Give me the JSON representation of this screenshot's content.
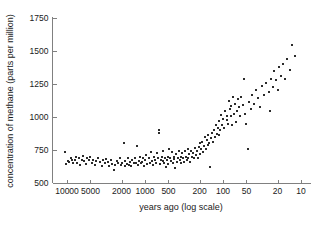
{
  "chart_data": {
    "type": "scatter",
    "title": "",
    "xlabel": "years ago (log scale)",
    "ylabel": "concentration of methane (parts per million)",
    "xscale": "log",
    "x_reversed": true,
    "xlim": [
      10,
      12000
    ],
    "ylim": [
      500,
      1750
    ],
    "grid": false,
    "legend": null,
    "xticks": [
      10000,
      5000,
      2000,
      1000,
      500,
      200,
      100,
      50,
      20,
      10
    ],
    "xticklabels": [
      "10000",
      "5000",
      "2000",
      "1000",
      "500",
      "200",
      "100",
      "50",
      "20",
      "10"
    ],
    "yticks": [
      500,
      750,
      1000,
      1250,
      1500,
      1750
    ],
    "yticklabels": [
      "500",
      "750",
      "1000",
      "1250",
      "1500",
      "1750"
    ],
    "marker": "square",
    "marker_color": "#2b2b2b",
    "marker_size": 2,
    "points": [
      [
        10500,
        735
      ],
      [
        10200,
        645
      ],
      [
        9700,
        668
      ],
      [
        9300,
        660
      ],
      [
        9000,
        690
      ],
      [
        8600,
        672
      ],
      [
        8300,
        648
      ],
      [
        8000,
        678
      ],
      [
        7700,
        700
      ],
      [
        7400,
        655
      ],
      [
        7100,
        688
      ],
      [
        6800,
        640
      ],
      [
        6500,
        672
      ],
      [
        6250,
        702
      ],
      [
        6000,
        665
      ],
      [
        5750,
        645
      ],
      [
        5500,
        686
      ],
      [
        5250,
        672
      ],
      [
        5000,
        700
      ],
      [
        4800,
        652
      ],
      [
        4600,
        678
      ],
      [
        4400,
        640
      ],
      [
        4200,
        668
      ],
      [
        4000,
        690
      ],
      [
        3800,
        660
      ],
      [
        3600,
        628
      ],
      [
        3450,
        672
      ],
      [
        3300,
        648
      ],
      [
        3150,
        684
      ],
      [
        3000,
        662
      ],
      [
        2880,
        632
      ],
      [
        2760,
        672
      ],
      [
        2640,
        645
      ],
      [
        2520,
        600
      ],
      [
        2400,
        638
      ],
      [
        2300,
        668
      ],
      [
        2200,
        655
      ],
      [
        2100,
        690
      ],
      [
        2020,
        640
      ],
      [
        1950,
        652
      ],
      [
        1880,
        805
      ],
      [
        1830,
        628
      ],
      [
        1780,
        668
      ],
      [
        1720,
        645
      ],
      [
        1660,
        688
      ],
      [
        1600,
        640
      ],
      [
        1550,
        660
      ],
      [
        1500,
        632
      ],
      [
        1450,
        672
      ],
      [
        1400,
        648
      ],
      [
        1360,
        690
      ],
      [
        1320,
        655
      ],
      [
        1280,
        778
      ],
      [
        1240,
        640
      ],
      [
        1200,
        668
      ],
      [
        1160,
        700
      ],
      [
        1120,
        648
      ],
      [
        1080,
        660
      ],
      [
        1050,
        690
      ],
      [
        1020,
        632
      ],
      [
        990,
        672
      ],
      [
        960,
        712
      ],
      [
        930,
        645
      ],
      [
        900,
        688
      ],
      [
        870,
        655
      ],
      [
        845,
        735
      ],
      [
        820,
        668
      ],
      [
        795,
        640
      ],
      [
        770,
        700
      ],
      [
        745,
        672
      ],
      [
        720,
        655
      ],
      [
        700,
        725
      ],
      [
        680,
        690
      ],
      [
        660,
        900
      ],
      [
        655,
        880
      ],
      [
        640,
        645
      ],
      [
        625,
        672
      ],
      [
        610,
        700
      ],
      [
        595,
        668
      ],
      [
        580,
        740
      ],
      [
        565,
        655
      ],
      [
        550,
        688
      ],
      [
        540,
        620
      ],
      [
        525,
        672
      ],
      [
        512,
        700
      ],
      [
        500,
        645
      ],
      [
        488,
        760
      ],
      [
        476,
        690
      ],
      [
        464,
        668
      ],
      [
        452,
        735
      ],
      [
        440,
        655
      ],
      [
        430,
        700
      ],
      [
        420,
        680
      ],
      [
        410,
        612
      ],
      [
        400,
        722
      ],
      [
        390,
        660
      ],
      [
        380,
        690
      ],
      [
        370,
        745
      ],
      [
        360,
        672
      ],
      [
        350,
        700
      ],
      [
        342,
        648
      ],
      [
        334,
        725
      ],
      [
        325,
        688
      ],
      [
        317,
        660
      ],
      [
        309,
        740
      ],
      [
        300,
        700
      ],
      [
        292,
        672
      ],
      [
        285,
        755
      ],
      [
        278,
        690
      ],
      [
        270,
        718
      ],
      [
        263,
        662
      ],
      [
        256,
        745
      ],
      [
        250,
        700
      ],
      [
        243,
        728
      ],
      [
        237,
        688
      ],
      [
        230,
        765
      ],
      [
        224,
        712
      ],
      [
        218,
        740
      ],
      [
        212,
        690
      ],
      [
        206,
        772
      ],
      [
        200,
        722
      ],
      [
        195,
        800
      ],
      [
        190,
        755
      ],
      [
        185,
        812
      ],
      [
        180,
        735
      ],
      [
        175,
        782
      ],
      [
        170,
        848
      ],
      [
        166,
        760
      ],
      [
        162,
        825
      ],
      [
        158,
        790
      ],
      [
        154,
        862
      ],
      [
        150,
        800
      ],
      [
        146,
        620
      ],
      [
        142,
        838
      ],
      [
        138,
        880
      ],
      [
        134,
        812
      ],
      [
        130,
        905
      ],
      [
        127,
        845
      ],
      [
        124,
        938
      ],
      [
        120,
        875
      ],
      [
        117,
        920
      ],
      [
        114,
        862
      ],
      [
        111,
        970
      ],
      [
        108,
        905
      ],
      [
        105,
        1015
      ],
      [
        102,
        942
      ],
      [
        99,
        988
      ],
      [
        96,
        920
      ],
      [
        93,
        1048
      ],
      [
        90,
        975
      ],
      [
        88,
        1010
      ],
      [
        86,
        945
      ],
      [
        84,
        1118
      ],
      [
        82,
        1058
      ],
      [
        80,
        1005
      ],
      [
        78,
        1082
      ],
      [
        76,
        940
      ],
      [
        74,
        1148
      ],
      [
        72,
        1022
      ],
      [
        70,
        1095
      ],
      [
        68,
        960
      ],
      [
        66,
        1042
      ],
      [
        64,
        1138
      ],
      [
        62,
        1075
      ],
      [
        60,
        1008
      ],
      [
        58,
        1152
      ],
      [
        56,
        1088
      ],
      [
        54,
        1290
      ],
      [
        52,
        1025
      ],
      [
        50,
        945
      ],
      [
        48,
        758
      ],
      [
        46,
        1112
      ],
      [
        44,
        1060
      ],
      [
        42,
        1165
      ],
      [
        40,
        1098
      ],
      [
        38,
        1205
      ],
      [
        36,
        1142
      ],
      [
        34,
        1078
      ],
      [
        32,
        1232
      ],
      [
        30,
        1168
      ],
      [
        28,
        1258
      ],
      [
        26,
        1192
      ],
      [
        25,
        1048
      ],
      [
        24,
        1290
      ],
      [
        23,
        1225
      ],
      [
        22,
        1352
      ],
      [
        21,
        1282
      ],
      [
        20,
        1205
      ],
      [
        19,
        1378
      ],
      [
        18,
        1312
      ],
      [
        17,
        1402
      ],
      [
        16,
        1285
      ],
      [
        15,
        1438
      ],
      [
        14,
        1358
      ],
      [
        13,
        1545
      ],
      [
        12,
        1462
      ]
    ]
  }
}
